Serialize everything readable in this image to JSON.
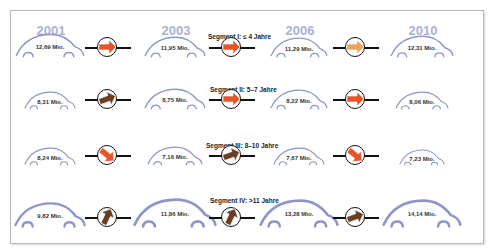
{
  "years": [
    "2001",
    "2003",
    "2006",
    "2010"
  ],
  "colors": {
    "car_outline": "#8e96c9",
    "year_text": "#a9b1d6",
    "arrow_decrease": "#e8532a",
    "arrow_slight_decrease": "#f0a15a",
    "arrow_increase": "#6b3f22",
    "frame_border": "#b8b8b8"
  },
  "segments": [
    {
      "title": "Segment I: ≤ 4 Jahre",
      "values": [
        "12,69 Mio.",
        "11,95 Mio.",
        "11,29 Mio.",
        "12,31 Mio."
      ],
      "arrows": [
        {
          "type": "decrease",
          "direction": "right"
        },
        {
          "type": "decrease",
          "direction": "right"
        },
        {
          "type": "slight-decrease",
          "direction": "right"
        }
      ]
    },
    {
      "title": "Segment II: 5–7 Jahre",
      "values": [
        "8,31 Mio.",
        "8,75 Mio.",
        "8,22 Mio.",
        "8,06 Mio."
      ],
      "arrows": [
        {
          "type": "increase",
          "direction": "right-up"
        },
        {
          "type": "decrease",
          "direction": "right"
        },
        {
          "type": "decrease",
          "direction": "right"
        }
      ]
    },
    {
      "title": "Segment III:  8–10 Jahre",
      "values": [
        "8,24 Mio.",
        "7,16 Mio.",
        "7,67 Mio.",
        "7,23 Mio."
      ],
      "arrows": [
        {
          "type": "decrease",
          "direction": "right-down"
        },
        {
          "type": "increase",
          "direction": "right-up"
        },
        {
          "type": "decrease",
          "direction": "right-down"
        }
      ]
    },
    {
      "title": "Segment IV:   >11 Jahre",
      "values": [
        "9,82 Mio.",
        "11,86 Mio.",
        "13,28 Mio.",
        "14,14 Mio."
      ],
      "arrows": [
        {
          "type": "increase",
          "direction": "up"
        },
        {
          "type": "increase",
          "direction": "up"
        },
        {
          "type": "increase",
          "direction": "right-up"
        }
      ]
    }
  ]
}
